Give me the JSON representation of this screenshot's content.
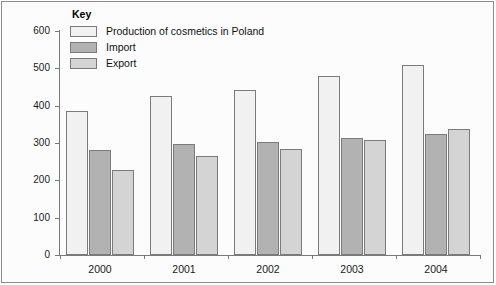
{
  "chart_data": {
    "type": "bar",
    "title": "",
    "xlabel": "",
    "ylabel": "",
    "ylim": [
      0,
      600
    ],
    "ytick_step": 100,
    "yticks": [
      0,
      100,
      200,
      300,
      400,
      500,
      600
    ],
    "categories": [
      "2000",
      "2001",
      "2002",
      "2003",
      "2004"
    ],
    "legend_title": "Key",
    "legend_position": "top-left-inside",
    "grid": false,
    "series": [
      {
        "name": "Production of cosmetics in Poland",
        "color": "#f1f1f1",
        "values": [
          386,
          427,
          441,
          480,
          508
        ]
      },
      {
        "name": "Import",
        "color": "#b2b2b2",
        "values": [
          280,
          298,
          302,
          314,
          324
        ]
      },
      {
        "name": "Export",
        "color": "#d4d4d4",
        "values": [
          228,
          266,
          284,
          309,
          337
        ]
      }
    ]
  },
  "axis": {
    "y_labels": [
      "600",
      "500",
      "400",
      "300",
      "200",
      "100",
      "0"
    ],
    "x_labels": [
      "2000",
      "2001",
      "2002",
      "2003",
      "2004"
    ]
  },
  "legend": {
    "title": "Key",
    "items": [
      {
        "label": "Production of cosmetics in Poland",
        "swatch": "production"
      },
      {
        "label": "Import",
        "swatch": "import"
      },
      {
        "label": "Export",
        "swatch": "export"
      }
    ]
  }
}
